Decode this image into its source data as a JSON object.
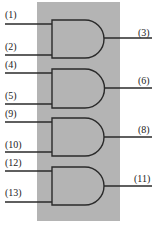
{
  "diagram": {
    "type": "AND gate IC pinout (quad 2-input AND)",
    "background_color": "#b4b4b4",
    "line_color": "#2a2a2a",
    "package": {
      "x": 37,
      "y": 2,
      "width": 83,
      "height": 219
    },
    "gates": [
      {
        "id": "gate-1",
        "type": "AND",
        "top": 20,
        "bottom": 58,
        "inputs": [
          {
            "pin": "(1)",
            "y": 24
          },
          {
            "pin": "(2)",
            "y": 55
          }
        ],
        "output": {
          "pin": "(3)",
          "y": 38
        }
      },
      {
        "id": "gate-2",
        "type": "AND",
        "top": 69,
        "bottom": 108,
        "inputs": [
          {
            "pin": "(4)",
            "y": 73
          },
          {
            "pin": "(5)",
            "y": 104
          }
        ],
        "output": {
          "pin": "(6)",
          "y": 88
        }
      },
      {
        "id": "gate-3",
        "type": "AND",
        "top": 118,
        "bottom": 156,
        "inputs": [
          {
            "pin": "(9)",
            "y": 122
          },
          {
            "pin": "(10)",
            "y": 152
          }
        ],
        "output": {
          "pin": "(8)",
          "y": 137
        }
      },
      {
        "id": "gate-4",
        "type": "AND",
        "top": 167,
        "bottom": 205,
        "inputs": [
          {
            "pin": "(12)",
            "y": 171
          },
          {
            "pin": "(13)",
            "y": 202
          }
        ],
        "output": {
          "pin": "(11)",
          "y": 186
        }
      }
    ],
    "labels": {
      "pin1": "(1)",
      "pin2": "(2)",
      "pin3": "(3)",
      "pin4": "(4)",
      "pin5": "(5)",
      "pin6": "(6)",
      "pin9": "(9)",
      "pin10": "(10)",
      "pin8": "(8)",
      "pin12": "(12)",
      "pin13": "(13)",
      "pin11": "(11)"
    }
  }
}
